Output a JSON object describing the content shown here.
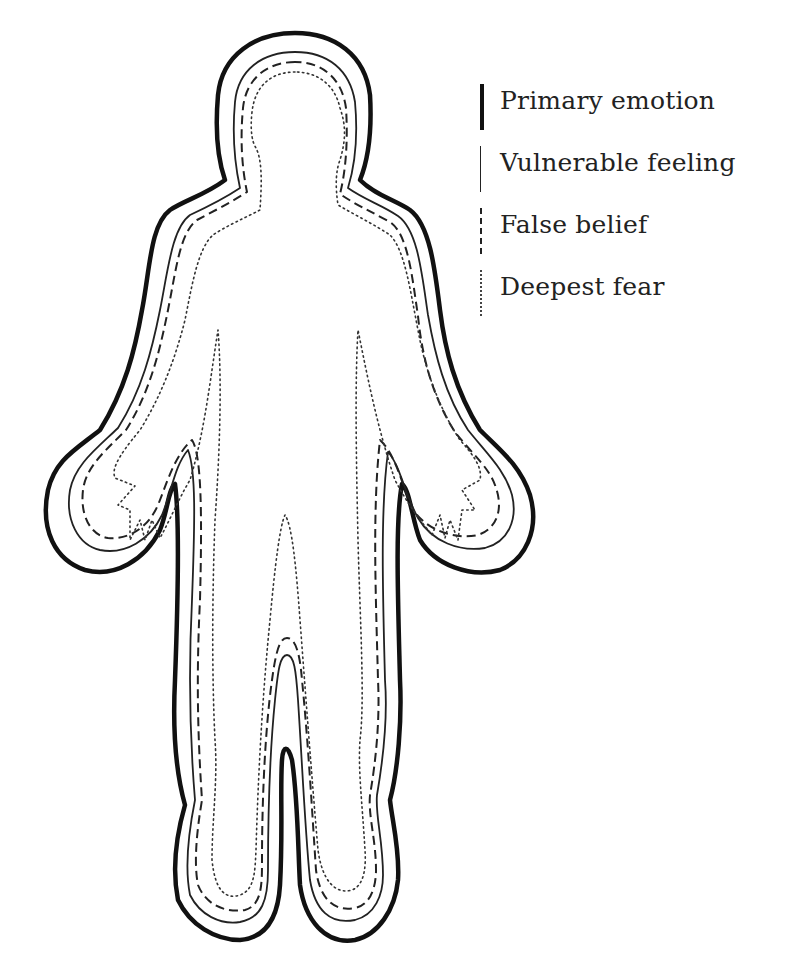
{
  "diagram": {
    "type": "body-outline-layers",
    "figure": "human silhouette with four concentric outlines",
    "layers": [
      {
        "name": "Primary emotion",
        "line_style": "thick-solid",
        "order": "outermost"
      },
      {
        "name": "Vulnerable feeling",
        "line_style": "thin-solid",
        "order": "second"
      },
      {
        "name": "False belief",
        "line_style": "dashed",
        "order": "third"
      },
      {
        "name": "Deepest fear",
        "line_style": "dotted",
        "order": "innermost"
      }
    ]
  },
  "legend": {
    "items": [
      {
        "label": "Primary emotion",
        "style": "thick"
      },
      {
        "label": "Vulnerable feeling",
        "style": "thin"
      },
      {
        "label": "False belief",
        "style": "dashed"
      },
      {
        "label": "Deepest fear",
        "style": "dotted"
      }
    ]
  },
  "colors": {
    "line": "#111111",
    "background": "#ffffff"
  }
}
